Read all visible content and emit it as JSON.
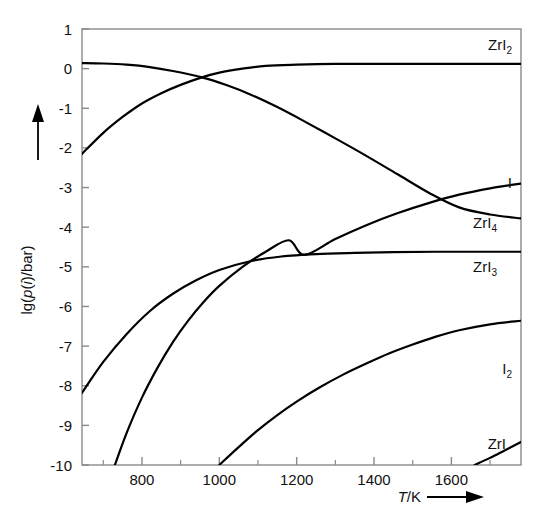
{
  "chart_data": {
    "type": "line",
    "title": "",
    "xlabel": "T/K",
    "ylabel": "lg(p(i)/bar)",
    "xlim": [
      645,
      1780
    ],
    "ylim": [
      -10,
      1
    ],
    "grid": false,
    "legend_position": "inline-right-end-labels",
    "x_ticks": [
      800,
      1000,
      1200,
      1400,
      1600
    ],
    "x_tick_labels": [
      "800",
      "1000",
      "1200",
      "1400",
      "1600"
    ],
    "x_minor_ticks": [
      700,
      900,
      1100,
      1300,
      1500,
      1700
    ],
    "y_ticks": [
      1,
      0,
      -1,
      -2,
      -3,
      -4,
      -5,
      -6,
      -7,
      -8,
      -9,
      -10
    ],
    "y_tick_labels": [
      "1",
      "0",
      "-1",
      "-2",
      "-3",
      "-4",
      "-5",
      "-6",
      "-7",
      "-8",
      "-9",
      "-10"
    ],
    "series": [
      {
        "name": "ZrI2",
        "label": "ZrI",
        "label_sub": "2",
        "points": [
          [
            645,
            -2.15
          ],
          [
            700,
            -1.62
          ],
          [
            750,
            -1.22
          ],
          [
            800,
            -0.88
          ],
          [
            850,
            -0.62
          ],
          [
            900,
            -0.41
          ],
          [
            955,
            -0.22
          ],
          [
            1000,
            -0.1
          ],
          [
            1060,
            0.0
          ],
          [
            1120,
            0.07
          ],
          [
            1200,
            0.1
          ],
          [
            1300,
            0.12
          ],
          [
            1400,
            0.12
          ],
          [
            1500,
            0.12
          ],
          [
            1600,
            0.12
          ],
          [
            1780,
            0.12
          ]
        ]
      },
      {
        "name": "ZrI4",
        "label": "ZrI",
        "label_sub": "4",
        "points": [
          [
            645,
            0.14
          ],
          [
            700,
            0.13
          ],
          [
            760,
            0.1
          ],
          [
            820,
            0.04
          ],
          [
            880,
            -0.06
          ],
          [
            955,
            -0.22
          ],
          [
            1020,
            -0.42
          ],
          [
            1080,
            -0.65
          ],
          [
            1150,
            -0.97
          ],
          [
            1220,
            -1.33
          ],
          [
            1300,
            -1.76
          ],
          [
            1380,
            -2.2
          ],
          [
            1460,
            -2.66
          ],
          [
            1545,
            -3.15
          ],
          [
            1620,
            -3.5
          ],
          [
            1700,
            -3.68
          ],
          [
            1780,
            -3.78
          ]
        ]
      },
      {
        "name": "I",
        "label": "I",
        "label_sub": "",
        "points": [
          [
            730,
            -10.0
          ],
          [
            760,
            -9.2
          ],
          [
            800,
            -8.3
          ],
          [
            840,
            -7.55
          ],
          [
            880,
            -6.9
          ],
          [
            920,
            -6.35
          ],
          [
            960,
            -5.88
          ],
          [
            1000,
            -5.48
          ],
          [
            1060,
            -5.0
          ],
          [
            1120,
            -4.62
          ],
          [
            1180,
            -4.33
          ],
          [
            1220,
            -4.7
          ],
          [
            1300,
            -4.3
          ],
          [
            1380,
            -3.95
          ],
          [
            1460,
            -3.65
          ],
          [
            1545,
            -3.38
          ],
          [
            1620,
            -3.18
          ],
          [
            1700,
            -3.02
          ],
          [
            1780,
            -2.9
          ]
        ]
      },
      {
        "name": "ZrI3",
        "label": "ZrI",
        "label_sub": "3",
        "points": [
          [
            645,
            -8.18
          ],
          [
            700,
            -7.4
          ],
          [
            760,
            -6.7
          ],
          [
            820,
            -6.12
          ],
          [
            880,
            -5.68
          ],
          [
            940,
            -5.34
          ],
          [
            1000,
            -5.08
          ],
          [
            1080,
            -4.86
          ],
          [
            1160,
            -4.74
          ],
          [
            1250,
            -4.68
          ],
          [
            1350,
            -4.65
          ],
          [
            1450,
            -4.63
          ],
          [
            1560,
            -4.62
          ],
          [
            1680,
            -4.62
          ],
          [
            1780,
            -4.62
          ]
        ]
      },
      {
        "name": "I2",
        "label": "I",
        "label_sub": "2",
        "points": [
          [
            1000,
            -10.0
          ],
          [
            1050,
            -9.55
          ],
          [
            1100,
            -9.12
          ],
          [
            1150,
            -8.74
          ],
          [
            1200,
            -8.4
          ],
          [
            1260,
            -8.04
          ],
          [
            1320,
            -7.72
          ],
          [
            1380,
            -7.44
          ],
          [
            1440,
            -7.18
          ],
          [
            1500,
            -6.96
          ],
          [
            1560,
            -6.76
          ],
          [
            1620,
            -6.6
          ],
          [
            1700,
            -6.45
          ],
          [
            1780,
            -6.36
          ]
        ]
      },
      {
        "name": "ZrI",
        "label": "ZrI",
        "label_sub": "",
        "points": [
          [
            1660,
            -10.0
          ],
          [
            1700,
            -9.82
          ],
          [
            1740,
            -9.62
          ],
          [
            1780,
            -9.42
          ]
        ]
      }
    ],
    "end_labels": [
      {
        "name": "ZrI2",
        "text": "ZrI",
        "sub": "2",
        "x": 512,
        "y": 50
      },
      {
        "name": "I",
        "text": "I",
        "sub": "",
        "x": 512,
        "y": 188
      },
      {
        "name": "ZrI4",
        "text": "ZrI",
        "sub": "4",
        "x": 497,
        "y": 228
      },
      {
        "name": "ZrI3",
        "text": "ZrI",
        "sub": "3",
        "x": 497,
        "y": 272
      },
      {
        "name": "I2",
        "text": "I",
        "sub": "2",
        "x": 512,
        "y": 374
      },
      {
        "name": "ZrI",
        "text": "ZrI",
        "sub": "",
        "x": 506,
        "y": 449
      }
    ]
  }
}
